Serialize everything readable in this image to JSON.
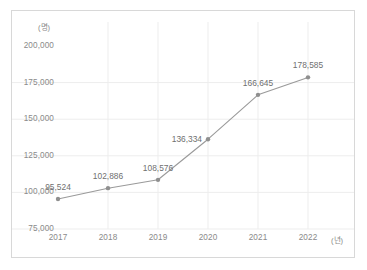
{
  "chart_data": {
    "type": "line",
    "title": "",
    "xlabel": "(년)",
    "ylabel": "(명)",
    "categories": [
      "2017",
      "2018",
      "2019",
      "2020",
      "2021",
      "2022"
    ],
    "values": [
      95524,
      102886,
      108576,
      136334,
      166645,
      178585
    ],
    "value_labels": [
      "95,524",
      "102,886",
      "108,576",
      "136,334",
      "166,645",
      "178,585"
    ],
    "series": [
      {
        "name": "",
        "values": [
          95524,
          102886,
          108576,
          136334,
          166645,
          178585
        ]
      }
    ],
    "ylim": [
      75000,
      200000
    ],
    "y_ticks": [
      200000,
      175000,
      150000,
      125000,
      100000,
      75000
    ],
    "y_tick_labels": [
      "200,000",
      "175,000",
      "150,000",
      "125,000",
      "100,000",
      "75,000"
    ],
    "grid": true,
    "legend": "none",
    "line_color": "#9a9a9a",
    "marker_color": "#8f8f8f",
    "grid_color": "#ededed",
    "axis_text_color": "#8a8a8a",
    "label_text_color": "#6f6f6f",
    "background_color": "#ffffff",
    "border_color": "#d8d8d8"
  },
  "axes": {
    "y_unit": "(명)",
    "x_unit": "(년)"
  }
}
